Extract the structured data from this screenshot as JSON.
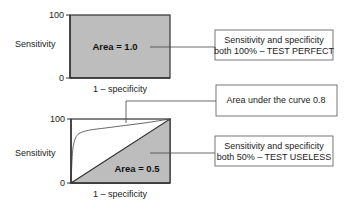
{
  "colors": {
    "fill": "#bdbdbd",
    "stroke": "#333333",
    "callout_border": "#555555",
    "connector": "#444444"
  },
  "chart_data": [
    {
      "type": "area",
      "title": "",
      "xlabel": "1 – specificity",
      "ylabel": "Sensitivity",
      "yticks": [
        "0",
        "100"
      ],
      "ylim": [
        0,
        100
      ],
      "xlim": [
        0,
        100
      ],
      "area_label": "Area = 1.0",
      "series": [
        {
          "name": "perfect test",
          "x": [
            0,
            0,
            100
          ],
          "y": [
            0,
            100,
            100
          ],
          "shaded": true
        }
      ],
      "callout": {
        "lines": [
          "Sensitivity and specificity",
          "both 100% – TEST PERFECT"
        ]
      }
    },
    {
      "type": "line",
      "title": "",
      "xlabel": "1 – specificity",
      "ylabel": "Sensitivity",
      "yticks": [
        "0",
        "100"
      ],
      "ylim": [
        0,
        100
      ],
      "xlim": [
        0,
        100
      ],
      "area_label": "Area = 0.5",
      "series": [
        {
          "name": "useless test (diagonal)",
          "x": [
            0,
            100
          ],
          "y": [
            0,
            100
          ],
          "shaded": true
        },
        {
          "name": "ROC curve",
          "x": [
            0,
            1,
            2,
            4,
            7,
            12,
            20,
            35,
            55,
            75,
            100
          ],
          "y": [
            0,
            35,
            55,
            68,
            76,
            80,
            83,
            86,
            90,
            94,
            100
          ],
          "shaded": false
        }
      ],
      "callouts": [
        {
          "target": "ROC curve",
          "lines": [
            "Area under the curve 0.8"
          ]
        },
        {
          "target": "diagonal",
          "lines": [
            "Sensitivity and specificity",
            "both 50% – TEST USELESS"
          ]
        }
      ]
    }
  ]
}
